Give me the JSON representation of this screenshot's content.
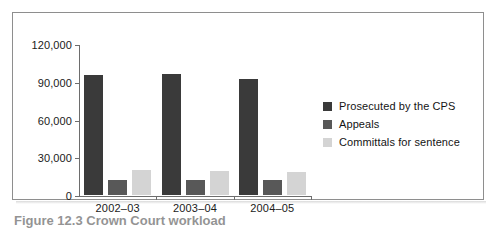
{
  "figure": {
    "caption": "Figure 12.3  Crown Court workload",
    "frame_color": "#8e8e8e"
  },
  "chart_data": {
    "type": "bar",
    "title": "",
    "subtitle": "",
    "xlabel": "",
    "ylabel": "",
    "categories": [
      "2002–03",
      "2003–04",
      "2004–05"
    ],
    "series": [
      {
        "name": "Prosecuted by the CPS",
        "color": "#3a3a3a",
        "values": [
          95500,
          96500,
          92000
        ]
      },
      {
        "name": "Appeals",
        "color": "#585858",
        "values": [
          12000,
          11800,
          12000
        ]
      },
      {
        "name": "Committals for sentence",
        "color": "#d4d4d4",
        "values": [
          19500,
          19000,
          18500
        ]
      }
    ],
    "ylim": [
      0,
      120000
    ],
    "ytick_values": [
      0,
      30000,
      60000,
      90000,
      120000
    ],
    "ytick_labels": [
      "0",
      "30,000",
      "60,000",
      "90,000",
      "120,000"
    ],
    "grid": false,
    "legend_position": "right"
  }
}
